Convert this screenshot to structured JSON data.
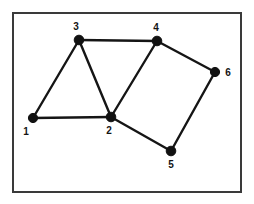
{
  "figure": {
    "canvas": {
      "width": 254,
      "height": 204
    },
    "background_color": "#ffffff",
    "frame": {
      "x": 13,
      "y": 13,
      "width": 228,
      "height": 179,
      "stroke_color": "#3a3a3a",
      "stroke_width": 2,
      "fill_color": "#ffffff"
    },
    "style": {
      "edge_color": "#151515",
      "edge_width": 2.4,
      "node_color": "#111111",
      "node_radius": 4.6,
      "label_color": "#141414",
      "label_size": 10
    }
  },
  "chart_data": {
    "type": "diagram",
    "subtype": "node-link-graph",
    "directed": false,
    "weighted": false,
    "node_count": 6,
    "edge_count": 8,
    "nodes": [
      {
        "id": "1",
        "label": "1",
        "x": 33,
        "y": 118,
        "r": 4.6,
        "label_x": 26,
        "label_y": 132,
        "label_anchor": "below-left"
      },
      {
        "id": "2",
        "label": "2",
        "x": 111,
        "y": 117,
        "r": 4.8,
        "label_x": 109,
        "label_y": 131,
        "label_anchor": "below"
      },
      {
        "id": "3",
        "label": "3",
        "x": 79,
        "y": 40,
        "r": 4.8,
        "label_x": 76,
        "label_y": 27,
        "label_anchor": "above"
      },
      {
        "id": "4",
        "label": "4",
        "x": 157,
        "y": 41,
        "r": 4.8,
        "label_x": 156,
        "label_y": 28,
        "label_anchor": "above"
      },
      {
        "id": "5",
        "label": "5",
        "x": 171,
        "y": 151,
        "r": 4.8,
        "label_x": 171,
        "label_y": 165,
        "label_anchor": "below"
      },
      {
        "id": "6",
        "label": "6",
        "x": 215,
        "y": 72,
        "r": 4.6,
        "label_x": 228,
        "label_y": 73,
        "label_anchor": "right"
      }
    ],
    "edges": [
      {
        "source": "1",
        "target": "3"
      },
      {
        "source": "1",
        "target": "2"
      },
      {
        "source": "3",
        "target": "4"
      },
      {
        "source": "3",
        "target": "2"
      },
      {
        "source": "4",
        "target": "2"
      },
      {
        "source": "4",
        "target": "6"
      },
      {
        "source": "2",
        "target": "5"
      },
      {
        "source": "5",
        "target": "6"
      }
    ],
    "adjacency": {
      "1": [
        "2",
        "3"
      ],
      "2": [
        "1",
        "3",
        "4",
        "5"
      ],
      "3": [
        "1",
        "2",
        "4"
      ],
      "4": [
        "2",
        "3",
        "6"
      ],
      "5": [
        "2",
        "6"
      ],
      "6": [
        "4",
        "5"
      ]
    },
    "degrees": {
      "1": 2,
      "2": 4,
      "3": 3,
      "4": 3,
      "5": 2,
      "6": 2
    },
    "xlabel": "",
    "ylabel": "",
    "grid": false,
    "legend": false
  }
}
